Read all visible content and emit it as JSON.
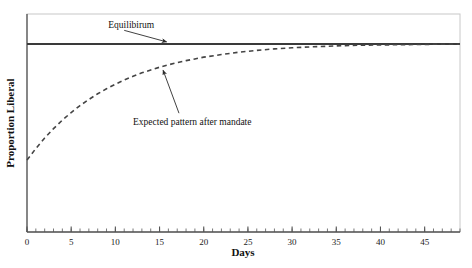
{
  "chart_data": {
    "type": "line",
    "title": "",
    "xlabel": "Days",
    "ylabel": "Proportion Liberal",
    "xlim": [
      0,
      49
    ],
    "ylim": [
      0,
      1
    ],
    "grid": false,
    "legend": "none",
    "xticks": [
      0,
      5,
      10,
      15,
      20,
      25,
      30,
      35,
      40,
      45
    ],
    "xtick_labels": [
      "0",
      "5",
      "10",
      "15",
      "20",
      "25",
      "30",
      "35",
      "40",
      "45"
    ],
    "xminor_tick_interval": 1,
    "yticks": [],
    "ytick_labels": [],
    "series": [
      {
        "name": "Equilibirum",
        "style": "solid",
        "color": "#3a3a3a",
        "width": 2,
        "x": [
          0,
          49
        ],
        "values": [
          0.862,
          0.862
        ]
      },
      {
        "name": "Expected pattern after mandate",
        "style": "dashed",
        "color": "#444444",
        "width": 1.6,
        "x": [
          0,
          1,
          2,
          3,
          4,
          5,
          6,
          7,
          8,
          9,
          10,
          11,
          12,
          13,
          14,
          15,
          16,
          17,
          18,
          19,
          20,
          22,
          24,
          26,
          28,
          30,
          32,
          34,
          36,
          38,
          40,
          42,
          44,
          46,
          49
        ],
        "values": [
          0.33,
          0.383,
          0.431,
          0.474,
          0.513,
          0.548,
          0.58,
          0.608,
          0.634,
          0.657,
          0.678,
          0.697,
          0.714,
          0.73,
          0.743,
          0.756,
          0.767,
          0.777,
          0.786,
          0.794,
          0.802,
          0.814,
          0.825,
          0.833,
          0.84,
          0.845,
          0.849,
          0.852,
          0.855,
          0.857,
          0.858,
          0.859,
          0.86,
          0.861,
          0.862
        ]
      }
    ],
    "annotations": [
      {
        "text": "Equilibirum",
        "text_x": 9.2,
        "text_y": 0.935,
        "arrow_from_x": 11.0,
        "arrow_from_y": 0.925,
        "arrow_to_x": 15.8,
        "arrow_to_y": 0.872
      },
      {
        "text": "Expected pattern after mandate",
        "text_x": 12.0,
        "text_y": 0.492,
        "arrow_from_x": 17.2,
        "arrow_from_y": 0.545,
        "arrow_to_x": 15.4,
        "arrow_to_y": 0.742
      }
    ],
    "frame": {
      "border_color": "#c8c8c8",
      "axis_color": "#555555"
    }
  }
}
